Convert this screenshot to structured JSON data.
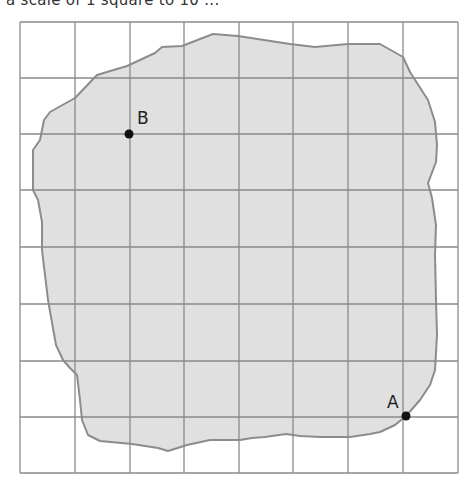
{
  "caption": "a scale of 1 square to 10 ...",
  "grid": {
    "columns": 8,
    "rows": 8,
    "origin_x": 20,
    "origin_y": 22,
    "cell_width": 54.75,
    "cell_height": 56.4,
    "line_color": "#8a8a8a"
  },
  "shape": {
    "fill_color": "#e0e0e0",
    "stroke_color": "#8c8c8c",
    "description": "irregular land region on square grid"
  },
  "points": [
    {
      "label": "B",
      "x": 129,
      "y": 134,
      "grid_col": 2,
      "grid_row": 2
    },
    {
      "label": "A",
      "x": 406,
      "y": 416,
      "grid_col": 7,
      "grid_row": 7
    }
  ]
}
